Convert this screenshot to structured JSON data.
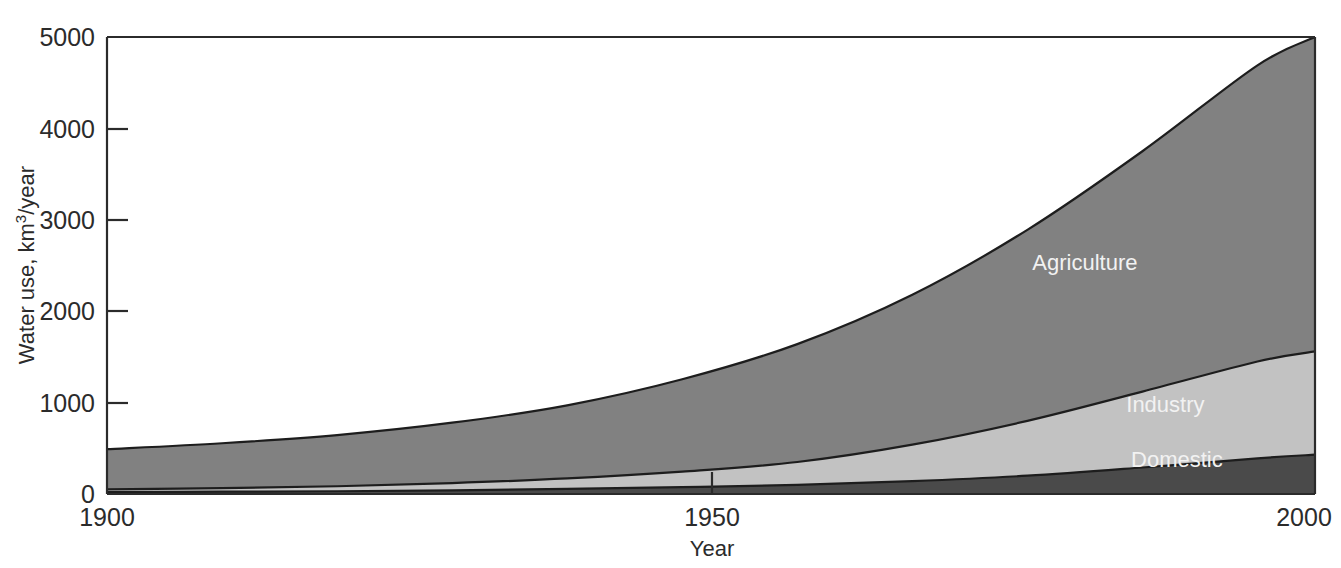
{
  "chart_data": {
    "type": "area",
    "stacked": true,
    "title": "",
    "xlabel": "Year",
    "ylabel": "Water use, km3/year",
    "ylabel_parts": {
      "pre": "Water use, km",
      "sup": "3",
      "post": "/year"
    },
    "x": [
      1900,
      1910,
      1920,
      1930,
      1940,
      1950,
      1960,
      1970,
      1980,
      1990,
      2000,
      2005
    ],
    "xlim": [
      1900,
      2005
    ],
    "ylim": [
      0,
      5000
    ],
    "xticks": [
      1900,
      1950,
      2000
    ],
    "xtick_labels": [
      "1900",
      "1950",
      "2000"
    ],
    "yticks": [
      0,
      1000,
      2000,
      3000,
      4000,
      5000
    ],
    "ytick_labels": [
      "0",
      "1000",
      "2000",
      "3000",
      "4000",
      "5000"
    ],
    "grid": false,
    "legend_position": "inline-labels",
    "series": [
      {
        "name": "Domestic",
        "color": "#4a4a4a",
        "label_color": "#f2f2f2",
        "values": [
          20,
          25,
          30,
          40,
          55,
          75,
          100,
          140,
          200,
          290,
          390,
          430
        ]
      },
      {
        "name": "Industry",
        "color": "#c2c2c2",
        "label_color": "#ffffff",
        "values": [
          30,
          40,
          55,
          80,
          115,
          170,
          250,
          400,
          600,
          830,
          1060,
          1130
        ]
      },
      {
        "name": "Agriculture",
        "color": "#818181",
        "label_color": "#f0f0f0",
        "values": [
          440,
          490,
          560,
          660,
          800,
          1010,
          1290,
          1640,
          2090,
          2630,
          3240,
          3440
        ]
      }
    ],
    "totals": [
      490,
      555,
      645,
      780,
      970,
      1255,
      1640,
      2180,
      2890,
      3750,
      4690,
      5000
    ],
    "annotations": [
      {
        "text": "Agriculture",
        "x": 1985,
        "y": 2450
      },
      {
        "text": "Industry",
        "x": 1992,
        "y": 900
      },
      {
        "text": "Domestic",
        "x": 1993,
        "y": 300
      }
    ]
  },
  "axis": {
    "x_title": "Year",
    "y_title_pre": "Water use, km",
    "y_title_sup": "3",
    "y_title_post": "/year",
    "x_tick_1": "1900",
    "x_tick_2": "1950",
    "x_tick_3": "2000",
    "y_tick_0": "0",
    "y_tick_1000": "1000",
    "y_tick_2000": "2000",
    "y_tick_3000": "3000",
    "y_tick_4000": "4000",
    "y_tick_5000": "5000"
  },
  "labels": {
    "agriculture": "Agriculture",
    "industry": "Industry",
    "domestic": "Domestic"
  }
}
